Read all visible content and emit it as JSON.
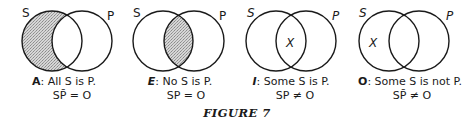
{
  "figure": {
    "caption": "FIGURE 7"
  },
  "diagrams": [
    {
      "id": "A",
      "set_labels": {
        "left": "S",
        "right": "P"
      },
      "shaded_region": "S-only",
      "marker": null,
      "statement_letter": "A",
      "statement_sep": ":",
      "statement_text": "All S is P.",
      "formula": "SP̄ = O"
    },
    {
      "id": "E",
      "set_labels": {
        "left": "S",
        "right": "P"
      },
      "shaded_region": "intersection",
      "marker": null,
      "statement_letter": "E",
      "statement_sep": ":",
      "statement_text": "No S is P.",
      "formula": "SP = O"
    },
    {
      "id": "I",
      "set_labels": {
        "left": "S",
        "right": "P"
      },
      "shaded_region": null,
      "marker": "X",
      "marker_region": "intersection",
      "statement_letter": "I",
      "statement_sep": ":",
      "statement_text": "Some S is P.",
      "formula": "SP ≠ O"
    },
    {
      "id": "O",
      "set_labels": {
        "left": "S",
        "right": "P"
      },
      "shaded_region": null,
      "marker": "X",
      "marker_region": "S-only",
      "statement_letter": "O",
      "statement_sep": ":",
      "statement_text": "Some S is not P.",
      "formula": "SP̄ ≠ O"
    }
  ],
  "colors": {
    "stroke": "#1a1a1a",
    "shade": "#c8c8c8"
  }
}
